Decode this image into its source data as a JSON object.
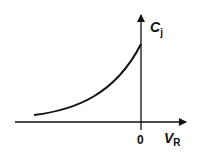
{
  "diagram": {
    "y_axis": {
      "symbol": "C",
      "subscript": "j"
    },
    "x_axis": {
      "symbol": "V",
      "subscript": "R"
    },
    "origin_label": "0",
    "curve": "exponential-rise",
    "colors": {
      "stroke": "#111111",
      "background": "#ffffff"
    }
  }
}
